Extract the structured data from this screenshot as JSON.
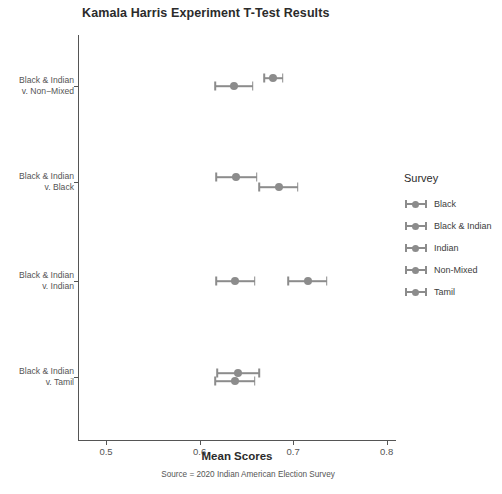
{
  "chart_data": {
    "type": "scatter",
    "title": "Kamala Harris Experiment T-Test Results",
    "xlabel": "Mean Scores",
    "ylabel": "",
    "caption": "Source = 2020 Indian American Election Survey",
    "xlim": [
      0.47,
      0.81
    ],
    "xticks": [
      0.5,
      0.6,
      0.7,
      0.8
    ],
    "xtick_labels": [
      "0.5",
      "0.6",
      "0.7",
      "0.8"
    ],
    "grid": false,
    "legend_position": "right",
    "legend_title": "Survey",
    "legend_entries": [
      "Black",
      "Black & Indian",
      "Indian",
      "Non-Mixed",
      "Tamil"
    ],
    "categories": [
      "Black & Indian v. Non-Mixed",
      "Black & Indian v. Black",
      "Black & Indian v. Indian",
      "Black & Indian v. Tamil"
    ],
    "category_labels": [
      [
        "Black & Indian",
        "v. Non−Mixed"
      ],
      [
        "Black & Indian",
        "v. Black"
      ],
      [
        "Black & Indian",
        "v. Indian"
      ],
      [
        "Black & Indian",
        "v. Tamil"
      ]
    ],
    "marker_color": "#8c8c8c",
    "groups": [
      {
        "category": "Black & Indian v. Non-Mixed",
        "points": [
          {
            "survey": "Black & Indian",
            "mean": 0.637,
            "ci_low": 0.617,
            "ci_high": 0.657,
            "offset": 0
          },
          {
            "survey": "Non-Mixed",
            "mean": 0.679,
            "ci_low": 0.669,
            "ci_high": 0.689,
            "offset": -8
          }
        ]
      },
      {
        "category": "Black & Indian v. Black",
        "points": [
          {
            "survey": "Black & Indian",
            "mean": 0.639,
            "ci_low": 0.618,
            "ci_high": 0.661,
            "offset": -5
          },
          {
            "survey": "Black",
            "mean": 0.685,
            "ci_low": 0.664,
            "ci_high": 0.705,
            "offset": 5
          }
        ]
      },
      {
        "category": "Black & Indian v. Indian",
        "points": [
          {
            "survey": "Black & Indian",
            "mean": 0.638,
            "ci_low": 0.618,
            "ci_high": 0.659,
            "offset": 0
          },
          {
            "survey": "Indian",
            "mean": 0.716,
            "ci_low": 0.695,
            "ci_high": 0.736,
            "offset": 0
          }
        ]
      },
      {
        "category": "Black & Indian v. Tamil",
        "points": [
          {
            "survey": "Black & Indian",
            "mean": 0.641,
            "ci_low": 0.619,
            "ci_high": 0.664,
            "offset": -4
          },
          {
            "survey": "Tamil",
            "mean": 0.638,
            "ci_low": 0.617,
            "ci_high": 0.659,
            "offset": 4
          }
        ]
      }
    ]
  }
}
